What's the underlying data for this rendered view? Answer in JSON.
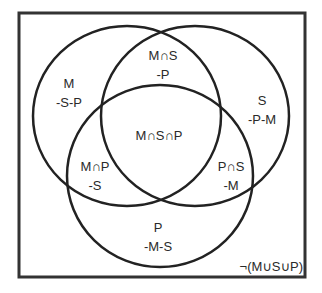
{
  "diagram": {
    "type": "venn",
    "universe": {
      "x": 19,
      "y": 13,
      "width": 286,
      "height": 264,
      "stroke": "#333333",
      "stroke_width": 3,
      "complement_label": "¬(M∪S∪P)"
    },
    "sets": [
      {
        "name": "M",
        "cx": 127,
        "cy": 116,
        "rx": 94,
        "ry": 90
      },
      {
        "name": "S",
        "cx": 195,
        "cy": 116,
        "rx": 94,
        "ry": 90
      },
      {
        "name": "P",
        "cx": 160,
        "cy": 176,
        "rx": 93,
        "ry": 91
      }
    ],
    "circle_stroke": "#222222",
    "circle_stroke_width": 2.5,
    "regions": [
      {
        "id": "m-only",
        "lines": [
          "M",
          "-S-P"
        ],
        "x": 69,
        "y": 88
      },
      {
        "id": "m-and-s-not-p",
        "lines": [
          "M∩S",
          "-P"
        ],
        "x": 163,
        "y": 60
      },
      {
        "id": "s-only",
        "lines": [
          "S",
          "-P-M"
        ],
        "x": 262,
        "y": 105
      },
      {
        "id": "m-and-s-and-p",
        "lines": [
          "M∩S∩P"
        ],
        "x": 159,
        "y": 140
      },
      {
        "id": "m-and-p-not-s",
        "lines": [
          "M∩P",
          "-S"
        ],
        "x": 95,
        "y": 171
      },
      {
        "id": "p-and-s-not-m",
        "lines": [
          "P∩S",
          "-M"
        ],
        "x": 231,
        "y": 171
      },
      {
        "id": "p-only",
        "lines": [
          "P",
          "-M-S"
        ],
        "x": 158,
        "y": 232
      }
    ],
    "complement_label_pos": {
      "x": 303,
      "y": 271
    }
  }
}
